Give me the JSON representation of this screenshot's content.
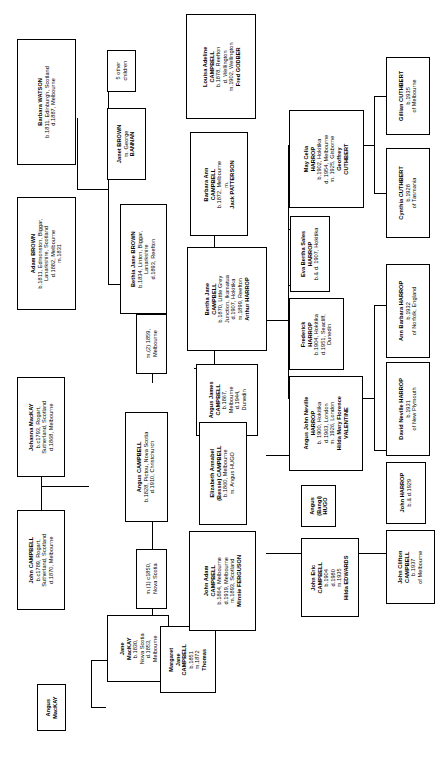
{
  "nodes": [
    {
      "id": "barbara-watson",
      "lines": [
        {
          "t": "Barbara WATSON",
          "b": true
        },
        {
          "t": "b.1811, Edinburgh, Scotland",
          "b": false
        },
        {
          "t": "d.1887, Melbourne",
          "b": false
        }
      ]
    },
    {
      "id": "adam-brown",
      "lines": [
        {
          "t": "Adam BROWN",
          "b": true
        },
        {
          "t": "b.1811, Edmonston, Biggar,",
          "b": false
        },
        {
          "t": "Lanarkshire, Scotland",
          "b": false
        },
        {
          "t": "d.1882, Melbourne",
          "b": false
        },
        {
          "t": "m.1831",
          "b": false
        }
      ]
    },
    {
      "id": "five-other-children",
      "lines": [
        {
          "t": "5 other",
          "b": false
        },
        {
          "t": "children",
          "b": false
        }
      ]
    },
    {
      "id": "janet-brown",
      "lines": [
        {
          "t": "Janet BROWN",
          "b": true
        },
        {
          "t": "m. George",
          "b": false
        },
        {
          "t": "BANNAN",
          "b": true
        }
      ]
    },
    {
      "id": "bethia-jane-brown",
      "lines": [
        {
          "t": "Bethia Jane BROWN",
          "b": true
        },
        {
          "t": "b.1834, Linton, Biggar,",
          "b": false
        },
        {
          "t": "Lanarkshire",
          "b": false
        },
        {
          "t": "d.1893, Reefton",
          "b": false
        }
      ]
    },
    {
      "id": "marriage-2",
      "lines": [
        {
          "t": "m.(2) 1859,",
          "b": false
        },
        {
          "t": "Melbourne",
          "b": false
        }
      ]
    },
    {
      "id": "johanna-mackay",
      "lines": [
        {
          "t": "Johanna MacKAY",
          "b": true
        },
        {
          "t": "b.c1793, Rogart,",
          "b": false
        },
        {
          "t": "Sutherland, Scotland",
          "b": false
        },
        {
          "t": "d.1868, Melbourne",
          "b": false
        }
      ]
    },
    {
      "id": "john-campbell",
      "lines": [
        {
          "t": "John CAMPBELL",
          "b": true
        },
        {
          "t": "b.c1789, Rogart,",
          "b": false
        },
        {
          "t": "Sutherland, Scotland",
          "b": false
        },
        {
          "t": "d.1870, Melbourne",
          "b": false
        }
      ]
    },
    {
      "id": "angus-campbell",
      "lines": [
        {
          "t": "Angus CAMPBELL",
          "b": true
        },
        {
          "t": "b.1828, Pictou, Nova Scotia",
          "b": false
        },
        {
          "t": "d.1910, Christchurch",
          "b": false
        }
      ]
    },
    {
      "id": "marriage-1",
      "lines": [
        {
          "t": "m.(1) c1850,",
          "b": false
        },
        {
          "t": "Nova Scotia",
          "b": false
        }
      ]
    },
    {
      "id": "jane-mackay",
      "lines": [
        {
          "t": "Jane",
          "b": true
        },
        {
          "t": "MacKAY",
          "b": true
        },
        {
          "t": "b.1830,",
          "b": false
        },
        {
          "t": "Nova Scotia",
          "b": false
        },
        {
          "t": "d.1853,",
          "b": false
        },
        {
          "t": "Melbourne",
          "b": false
        }
      ]
    },
    {
      "id": "angus-mackay",
      "lines": [
        {
          "t": "Angus",
          "b": true
        },
        {
          "t": "MacKAY",
          "b": true
        }
      ]
    },
    {
      "id": "margaret-jane-campbell",
      "lines": [
        {
          "t": "Margaret",
          "b": true
        },
        {
          "t": "Jane",
          "b": true
        },
        {
          "t": "CAMPBELL",
          "b": true
        },
        {
          "t": "b.1851",
          "b": false
        },
        {
          "t": "m.1872",
          "b": false
        },
        {
          "t": "Thomas",
          "b": true
        }
      ]
    },
    {
      "id": "louisa-adeline-campbell",
      "lines": [
        {
          "t": "Louisa Adeline",
          "b": true
        },
        {
          "t": "CAMPBELL",
          "b": true
        },
        {
          "t": "b.1878, Reefton",
          "b": false
        },
        {
          "t": "d. Wellington",
          "b": false
        },
        {
          "t": "m.1902, Wellington",
          "b": false
        },
        {
          "t": "Fred GODBER",
          "b": true
        }
      ]
    },
    {
      "id": "barbara-ann-campbell",
      "lines": [
        {
          "t": "Barbara Ann",
          "b": true
        },
        {
          "t": "CAMPBELL",
          "b": true
        },
        {
          "t": "b.1872, Melbourne",
          "b": false
        },
        {
          "t": "m.",
          "b": false
        },
        {
          "t": "Jack PATTERSON",
          "b": true
        }
      ]
    },
    {
      "id": "bertha-jane-campbell",
      "lines": [
        {
          "t": "Bertha Jane",
          "b": true
        },
        {
          "t": "CAMPBELL",
          "b": true
        },
        {
          "t": "b.1870, Little Grey",
          "b": false
        },
        {
          "t": "Junction, Ikamatua",
          "b": false
        },
        {
          "t": "d.1907, Hokitika",
          "b": false
        },
        {
          "t": "m.1899, Reefton",
          "b": false
        },
        {
          "t": "Arthur HARROP",
          "b": true
        }
      ]
    },
    {
      "id": "angus-james-campbell",
      "lines": [
        {
          "t": "Angus James",
          "b": true
        },
        {
          "t": "CAMPBELL",
          "b": true
        },
        {
          "t": "b.1867,",
          "b": false
        },
        {
          "t": "Melbourne",
          "b": false
        },
        {
          "t": "d.1944,",
          "b": false
        },
        {
          "t": "Dunedin",
          "b": false
        }
      ]
    },
    {
      "id": "elizabeth-annabel-campbell",
      "lines": [
        {
          "t": "Elizabeth Annabel",
          "b": true
        },
        {
          "t": "(Bessie) CAMPBELL",
          "b": true
        },
        {
          "t": "b.1860, Melbourne",
          "b": false
        },
        {
          "t": "m. Angus HUGO",
          "b": false
        }
      ]
    },
    {
      "id": "john-adam-campbell",
      "lines": [
        {
          "t": "John Adam",
          "b": true
        },
        {
          "t": "CAMPBELL",
          "b": true
        },
        {
          "t": "b.1864, Melbourne",
          "b": false
        },
        {
          "t": "d.1919, Melbourne",
          "b": false
        },
        {
          "t": "m.1893, Scotland",
          "b": false
        },
        {
          "t": "Minnie FERGUSON",
          "b": true
        }
      ]
    },
    {
      "id": "may-celia-harrop",
      "lines": [
        {
          "t": "May Celia",
          "b": true
        },
        {
          "t": "HARROP",
          "b": true
        },
        {
          "t": "b.1902, Hokitika",
          "b": false
        },
        {
          "t": "d. 1954, Melbourne",
          "b": false
        },
        {
          "t": "m. 1925, Gisborne",
          "b": false
        },
        {
          "t": "Geoffrey",
          "b": true
        },
        {
          "t": "CUTHBERT",
          "b": true
        }
      ]
    },
    {
      "id": "eva-bertha-sales-harrop",
      "lines": [
        {
          "t": "Eva Bertha Sales",
          "b": true
        },
        {
          "t": "HARROP",
          "b": true
        },
        {
          "t": "b.& d. 1907, Hokitika",
          "b": false
        }
      ]
    },
    {
      "id": "frederick-harrop",
      "lines": [
        {
          "t": "Frederick",
          "b": true
        },
        {
          "t": "HARROP",
          "b": true
        },
        {
          "t": "b.1904, Hokitika",
          "b": false
        },
        {
          "t": "d.1951, Seacliff,",
          "b": false
        },
        {
          "t": "Dunedin",
          "b": false
        }
      ]
    },
    {
      "id": "angus-john-neville-harrop",
      "lines": [
        {
          "t": "Angus John Neville",
          "b": true
        },
        {
          "t": "HARROP",
          "b": true
        },
        {
          "t": "b. 1900, Hokitika",
          "b": false
        },
        {
          "t": "d.1963, London",
          "b": false
        },
        {
          "t": "m. 1926, London",
          "b": false
        },
        {
          "t": "Hilda Mary Florence",
          "b": true
        },
        {
          "t": "VALENTINE",
          "b": true
        }
      ]
    },
    {
      "id": "angus-bangi-hugo",
      "lines": [
        {
          "t": "Angus",
          "b": true
        },
        {
          "t": "(Bangi)",
          "b": true
        },
        {
          "t": "HUGO",
          "b": true
        }
      ]
    },
    {
      "id": "john-eric-campbell",
      "lines": [
        {
          "t": "John Eric",
          "b": true
        },
        {
          "t": "CAMPBELL",
          "b": true
        },
        {
          "t": "b.1904",
          "b": false
        },
        {
          "t": "d.1980",
          "b": false
        },
        {
          "t": "m.1935",
          "b": false
        },
        {
          "t": "Hilda EDWARDS",
          "b": true
        }
      ]
    },
    {
      "id": "gillian-cuthbert",
      "lines": [
        {
          "t": "Gillian CUTHBERT",
          "b": true
        },
        {
          "t": "b.1935",
          "b": false
        },
        {
          "t": "of Melbourne",
          "b": false
        }
      ]
    },
    {
      "id": "cynthia-cuthbert",
      "lines": [
        {
          "t": "Cynthia CUTHBERT",
          "b": true
        },
        {
          "t": "b.1928",
          "b": false
        },
        {
          "t": "of Tasmania",
          "b": false
        }
      ]
    },
    {
      "id": "ann-barbara-harrop",
      "lines": [
        {
          "t": "Ann Barbara HARROP",
          "b": true
        },
        {
          "t": "b.1932",
          "b": false
        },
        {
          "t": "of Norfolk, England",
          "b": false
        }
      ]
    },
    {
      "id": "david-neville-harrop",
      "lines": [
        {
          "t": "David Neville HARROP",
          "b": true
        },
        {
          "t": "b.1931",
          "b": false
        },
        {
          "t": "of New Plymouth",
          "b": false
        }
      ]
    },
    {
      "id": "john-harrop",
      "lines": [
        {
          "t": "John HARROP",
          "b": true
        },
        {
          "t": "b.& d.1929",
          "b": false
        }
      ]
    },
    {
      "id": "john-clifton-campbell",
      "lines": [
        {
          "t": "John Clifton",
          "b": true
        },
        {
          "t": "CAMPBELL",
          "b": true
        },
        {
          "t": "b.1937",
          "b": false
        },
        {
          "t": "of Melbourne",
          "b": false
        }
      ]
    }
  ]
}
